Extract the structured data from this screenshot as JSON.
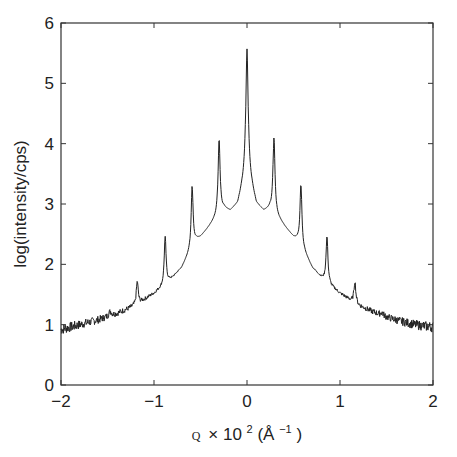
{
  "chart_data": {
    "type": "line",
    "title": "",
    "xlabel_parts": {
      "symbol": "Q",
      "times": "×",
      "base": "10",
      "exp": "2",
      "unit_open": " (Å",
      "unit_exp": "−1",
      "unit_close": ")"
    },
    "ylabel": "log(intensity/cps)",
    "xlim": [
      -2,
      2
    ],
    "ylim": [
      0,
      6
    ],
    "xticks": [
      -2,
      -1,
      0,
      1,
      2
    ],
    "xtick_labels": [
      "−2",
      "−1",
      "0",
      "1",
      "2"
    ],
    "yticks": [
      0,
      1,
      2,
      3,
      4,
      5,
      6
    ],
    "ytick_labels": [
      "0",
      "1",
      "2",
      "3",
      "4",
      "5",
      "6"
    ],
    "grid": false,
    "legend": null,
    "series": [
      {
        "name": "log intensity",
        "baseline_points": [
          [
            -2.0,
            0.92
          ],
          [
            -1.8,
            1.0
          ],
          [
            -1.6,
            1.08
          ],
          [
            -1.45,
            1.15
          ],
          [
            -1.3,
            1.25
          ],
          [
            -1.2,
            1.32
          ],
          [
            -1.1,
            1.42
          ],
          [
            -1.0,
            1.52
          ],
          [
            -0.92,
            1.62
          ],
          [
            -0.8,
            1.78
          ],
          [
            -0.7,
            1.95
          ],
          [
            -0.62,
            2.2
          ],
          [
            -0.55,
            2.4
          ],
          [
            -0.5,
            2.45
          ],
          [
            -0.42,
            2.6
          ],
          [
            -0.36,
            2.72
          ],
          [
            -0.25,
            2.92
          ],
          [
            -0.18,
            2.88
          ],
          [
            -0.1,
            3.0
          ],
          [
            -0.05,
            3.3
          ],
          [
            0.0,
            3.6
          ],
          [
            0.05,
            3.3
          ],
          [
            0.1,
            3.0
          ],
          [
            0.18,
            2.88
          ],
          [
            0.25,
            2.92
          ],
          [
            0.36,
            2.72
          ],
          [
            0.42,
            2.6
          ],
          [
            0.5,
            2.45
          ],
          [
            0.55,
            2.4
          ],
          [
            0.62,
            2.2
          ],
          [
            0.7,
            1.95
          ],
          [
            0.8,
            1.78
          ],
          [
            0.92,
            1.62
          ],
          [
            1.0,
            1.52
          ],
          [
            1.1,
            1.42
          ],
          [
            1.2,
            1.32
          ],
          [
            1.3,
            1.25
          ],
          [
            1.45,
            1.15
          ],
          [
            1.6,
            1.08
          ],
          [
            1.8,
            1.0
          ],
          [
            2.0,
            0.96
          ]
        ],
        "peaks": [
          {
            "q": -1.47,
            "height": 1.22,
            "width": 0.02
          },
          {
            "q": -1.18,
            "height": 1.72,
            "width": 0.012
          },
          {
            "q": -0.88,
            "height": 2.45,
            "width": 0.012
          },
          {
            "q": -0.59,
            "height": 3.3,
            "width": 0.012
          },
          {
            "q": -0.3,
            "height": 4.08,
            "width": 0.013
          },
          {
            "q": 0.0,
            "height": 5.57,
            "width": 0.015
          },
          {
            "q": 0.29,
            "height": 4.1,
            "width": 0.013
          },
          {
            "q": 0.58,
            "height": 3.33,
            "width": 0.012
          },
          {
            "q": 0.86,
            "height": 2.47,
            "width": 0.012
          },
          {
            "q": 1.16,
            "height": 1.72,
            "width": 0.012
          },
          {
            "q": 1.45,
            "height": 1.2,
            "width": 0.02
          }
        ],
        "noise_amplitude": 0.04
      }
    ]
  }
}
